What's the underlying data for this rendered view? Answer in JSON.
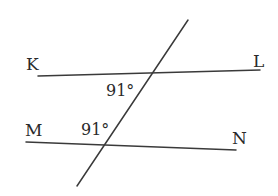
{
  "diagram": {
    "type": "parallel-lines-transversal",
    "points": {
      "K": "K",
      "L": "L",
      "M": "M",
      "N": "N"
    },
    "angles": {
      "upper": "91°",
      "lower": "91°"
    },
    "lines": [
      {
        "name": "KL",
        "from": [
          38,
          76
        ],
        "to": [
          260,
          70
        ]
      },
      {
        "name": "MN",
        "from": [
          26,
          142
        ],
        "to": [
          236,
          150
        ]
      },
      {
        "name": "transversal",
        "from": [
          188,
          20
        ],
        "to": [
          77,
          186
        ]
      }
    ],
    "colors": {
      "line": "#3a3a3a",
      "text": "#2a2a2a",
      "background": "#ffffff"
    }
  }
}
